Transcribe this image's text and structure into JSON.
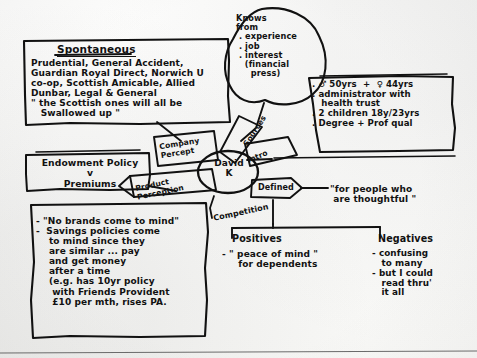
{
  "diagram": {
    "ink_color": "#111111",
    "paper_color": "#fafaf8"
  },
  "center_node": {
    "name": "David K",
    "line1": "David",
    "line2": "K"
  },
  "branch_labels": {
    "company_percept": "Company\nPercept",
    "sources": "Sources",
    "intro": "Intro",
    "defined": "Defined",
    "product_perception": "Product\nPerception",
    "competition": "Competition"
  },
  "spontaneous_box": {
    "title": "Spontaneous",
    "body": "Prudential, General Accident,\nGuardian Royal Direct, Norwich U\nco-op, Scottish Amicable, Allied\nDunbar, Legal & General\n\" the Scottish ones will all be\n   Swallowed up \""
  },
  "knows_cloud": {
    "text": "Knows\nfrom\n . experience\n . job\n . interest\n   (financial\n     press)"
  },
  "demographics_box": {
    "text": ". ♂ 50yrs  +  ♀ 44yrs\n. administrator with\n   health trust\n. 2 children 18y/23yrs\n. Degree + Prof qual"
  },
  "endowment_box": {
    "text": "Endowment Policy\nv\nPremiums"
  },
  "product_perception_box": {
    "text": "- \"No brands come to mind\"\n-  Savings policies come\n    to mind since they\n    are similar ... pay\n    and get money\n    after a time\n    (e.g. has 10yr policy\n     with Friends Provident\n     £10 per mth, rises PA."
  },
  "defined_quote": {
    "text": "\"for people who\n are thoughtful \""
  },
  "positives": {
    "title": "Positives",
    "body": "- \" peace of mind \"\n     for dependents"
  },
  "negatives": {
    "title": "Negatives",
    "body": "- confusing\n   to many\n- but I could\n   read thru'\n   it all"
  }
}
